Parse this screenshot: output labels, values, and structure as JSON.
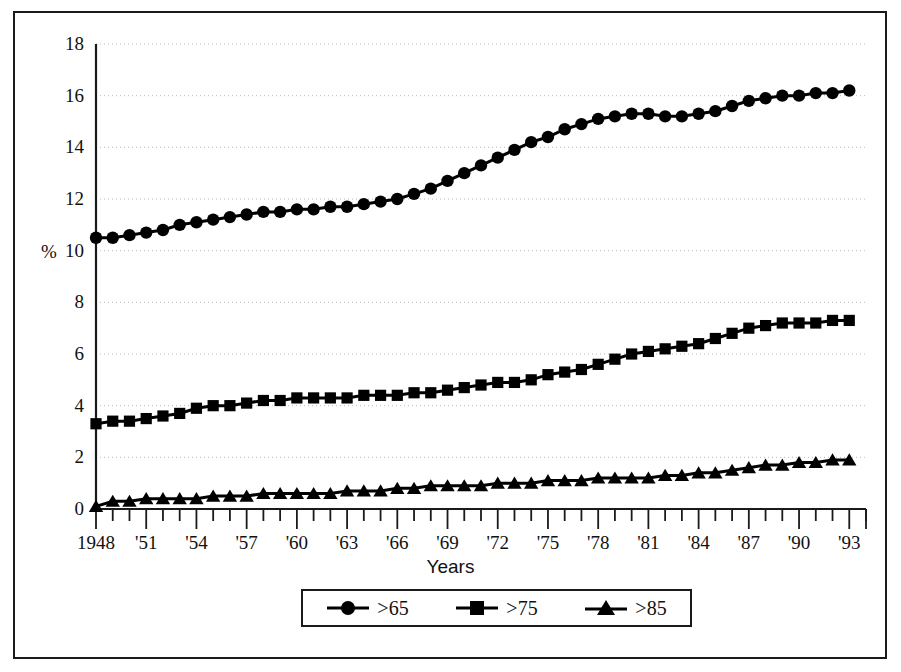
{
  "figure": {
    "frame_color": "#1a1a1a",
    "background": "#ffffff",
    "series_color": "#000000"
  },
  "axis": {
    "y_unit_label": "%",
    "x_title": "Years"
  },
  "legend": {
    "entries": [
      {
        "label": ">65",
        "marker": "circle-marker-icon"
      },
      {
        "label": ">75",
        "marker": "square-marker-icon"
      },
      {
        "label": ">85",
        "marker": "triangle-marker-icon"
      }
    ]
  },
  "chart_data": {
    "type": "line",
    "title": "",
    "xlabel": "Years",
    "ylabel": "%",
    "ylim": [
      0,
      18
    ],
    "xlim": [
      1948,
      1994
    ],
    "yticks": [
      0,
      2,
      4,
      6,
      8,
      10,
      12,
      14,
      16,
      18
    ],
    "ytick_labels": [
      "0",
      "2",
      "4",
      "6",
      "8",
      "10",
      "12",
      "14",
      "16",
      "18"
    ],
    "xticks": [
      1948,
      1949,
      1950,
      1951,
      1952,
      1953,
      1954,
      1955,
      1956,
      1957,
      1958,
      1959,
      1960,
      1961,
      1962,
      1963,
      1964,
      1965,
      1966,
      1967,
      1968,
      1969,
      1970,
      1971,
      1972,
      1973,
      1974,
      1975,
      1976,
      1977,
      1978,
      1979,
      1980,
      1981,
      1982,
      1983,
      1984,
      1985,
      1986,
      1987,
      1988,
      1989,
      1990,
      1991,
      1992,
      1993,
      1994
    ],
    "xtick_labels": [
      "1948",
      "'51",
      "'54",
      "'57",
      "'60",
      "'63",
      "'66",
      "'69",
      "'72",
      "'75",
      "'78",
      "'81",
      "'84",
      "'87",
      "'90",
      "'93"
    ],
    "xtick_label_years": [
      1948,
      1951,
      1954,
      1957,
      1960,
      1963,
      1966,
      1969,
      1972,
      1975,
      1978,
      1981,
      1984,
      1987,
      1990,
      1993
    ],
    "grid": "horizontal-dotted",
    "legend_position": "below-axes",
    "x": [
      1948,
      1949,
      1950,
      1951,
      1952,
      1953,
      1954,
      1955,
      1956,
      1957,
      1958,
      1959,
      1960,
      1961,
      1962,
      1963,
      1964,
      1965,
      1966,
      1967,
      1968,
      1969,
      1970,
      1971,
      1972,
      1973,
      1974,
      1975,
      1976,
      1977,
      1978,
      1979,
      1980,
      1981,
      1982,
      1983,
      1984,
      1985,
      1986,
      1987,
      1988,
      1989,
      1990,
      1991,
      1992,
      1993
    ],
    "series": [
      {
        "name": ">65",
        "marker": "circle",
        "values": [
          10.5,
          10.5,
          10.6,
          10.7,
          10.8,
          11.0,
          11.1,
          11.2,
          11.3,
          11.4,
          11.5,
          11.5,
          11.6,
          11.6,
          11.7,
          11.7,
          11.8,
          11.9,
          12.0,
          12.2,
          12.4,
          12.7,
          13.0,
          13.3,
          13.6,
          13.9,
          14.2,
          14.4,
          14.7,
          14.9,
          15.1,
          15.2,
          15.3,
          15.3,
          15.2,
          15.2,
          15.3,
          15.4,
          15.6,
          15.8,
          15.9,
          16.0,
          16.0,
          16.1,
          16.1,
          16.2
        ]
      },
      {
        "name": ">75",
        "marker": "square",
        "values": [
          3.3,
          3.4,
          3.4,
          3.5,
          3.6,
          3.7,
          3.9,
          4.0,
          4.0,
          4.1,
          4.2,
          4.2,
          4.3,
          4.3,
          4.3,
          4.3,
          4.4,
          4.4,
          4.4,
          4.5,
          4.5,
          4.6,
          4.7,
          4.8,
          4.9,
          4.9,
          5.0,
          5.2,
          5.3,
          5.4,
          5.6,
          5.8,
          6.0,
          6.1,
          6.2,
          6.3,
          6.4,
          6.6,
          6.8,
          7.0,
          7.1,
          7.2,
          7.2,
          7.2,
          7.3,
          7.3
        ]
      },
      {
        "name": ">85",
        "marker": "triangle",
        "values": [
          0.1,
          0.3,
          0.3,
          0.4,
          0.4,
          0.4,
          0.4,
          0.5,
          0.5,
          0.5,
          0.6,
          0.6,
          0.6,
          0.6,
          0.6,
          0.7,
          0.7,
          0.7,
          0.8,
          0.8,
          0.9,
          0.9,
          0.9,
          0.9,
          1.0,
          1.0,
          1.0,
          1.1,
          1.1,
          1.1,
          1.2,
          1.2,
          1.2,
          1.2,
          1.3,
          1.3,
          1.4,
          1.4,
          1.5,
          1.6,
          1.7,
          1.7,
          1.8,
          1.8,
          1.9,
          1.9
        ]
      }
    ]
  }
}
